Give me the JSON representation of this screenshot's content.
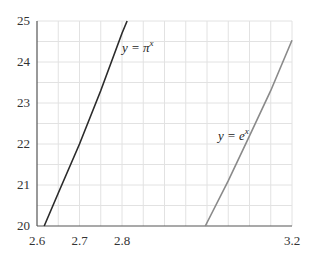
{
  "chart_data": {
    "type": "line",
    "title": "",
    "xlabel": "",
    "ylabel": "",
    "xlim": [
      2.6,
      3.2
    ],
    "ylim": [
      20,
      25
    ],
    "grid": true,
    "x_ticks": [
      {
        "value": 2.6,
        "label": "2.6"
      },
      {
        "value": 2.7,
        "label": "2.7"
      },
      {
        "value": 2.8,
        "label": "2.8"
      },
      {
        "value": 3.2,
        "label": "3.2"
      }
    ],
    "y_ticks": [
      {
        "value": 20,
        "label": "20"
      },
      {
        "value": 21,
        "label": "21"
      },
      {
        "value": 22,
        "label": "22"
      },
      {
        "value": 23,
        "label": "23"
      },
      {
        "value": 24,
        "label": "24"
      },
      {
        "value": 25,
        "label": "25"
      }
    ],
    "series": [
      {
        "name": "y = π^x",
        "label_main": "y = π",
        "label_sup": "x",
        "color": "#2b2b2b",
        "x": [
          2.617,
          2.65,
          2.7,
          2.75,
          2.8,
          2.812
        ],
        "values": [
          20.0,
          20.8,
          22.0,
          23.3,
          24.7,
          25.0
        ]
      },
      {
        "name": "y = e^x",
        "label_main": "y = e",
        "label_sup": "x",
        "color": "#8a8a8a",
        "x": [
          2.996,
          3.05,
          3.1,
          3.15,
          3.2
        ],
        "values": [
          20.0,
          21.1,
          22.2,
          23.3,
          24.53
        ]
      }
    ]
  }
}
